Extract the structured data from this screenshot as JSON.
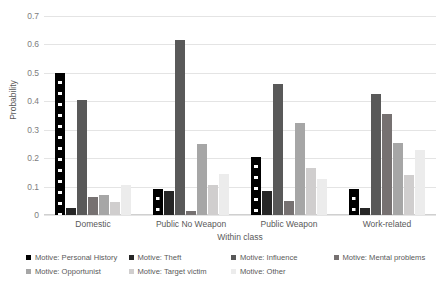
{
  "chart_data": {
    "type": "bar",
    "title": "",
    "xlabel": "Within class",
    "ylabel": "Probability",
    "ylim": [
      0,
      0.7
    ],
    "ytick_step": 0.1,
    "yticks": [
      "0",
      "0.1",
      "0.2",
      "0.3",
      "0.4",
      "0.5",
      "0.6",
      "0.7"
    ],
    "grid": true,
    "legend_position": "bottom",
    "grouping": "grouped",
    "categories": [
      "Domestic",
      "Public No Weapon",
      "Public Weapon",
      "Work-related"
    ],
    "series": [
      {
        "name": "Motive: Personal History",
        "color": "#000000",
        "pattern": "white-square-dots",
        "values": [
          0.5,
          0.09,
          0.205,
          0.09
        ]
      },
      {
        "name": "Motive: Theft",
        "color": "#262626",
        "pattern": "solid",
        "values": [
          0.025,
          0.085,
          0.085,
          0.025
        ]
      },
      {
        "name": "Motive: Influence",
        "color": "#595959",
        "pattern": "solid",
        "values": [
          0.405,
          0.615,
          0.46,
          0.425
        ]
      },
      {
        "name": "Motive: Mental problems",
        "color": "#767171",
        "pattern": "solid",
        "values": [
          0.065,
          0.015,
          0.05,
          0.355
        ]
      },
      {
        "name": "Motive: Opportunist",
        "color": "#a6a6a6",
        "pattern": "solid",
        "values": [
          0.07,
          0.25,
          0.325,
          0.255
        ]
      },
      {
        "name": "Motive: Target victim",
        "color": "#d0cece",
        "pattern": "solid",
        "values": [
          0.045,
          0.105,
          0.165,
          0.14
        ]
      },
      {
        "name": "Motive: Other",
        "color": "#ececec",
        "pattern": "solid",
        "values": [
          0.105,
          0.145,
          0.125,
          0.23
        ]
      }
    ]
  }
}
